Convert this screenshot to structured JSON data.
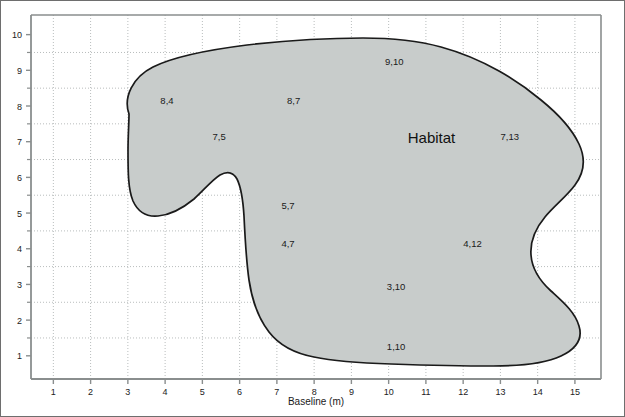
{
  "chart_data": {
    "type": "area",
    "title": "",
    "subtitle": "",
    "xlabel": "Baseline (m)",
    "ylabel": "",
    "xlim": [
      0.4,
      15.7
    ],
    "ylim": [
      0.35,
      10.55
    ],
    "xticks": [
      1,
      2,
      3,
      4,
      5,
      6,
      7,
      8,
      9,
      10,
      11,
      12,
      13,
      14,
      15
    ],
    "yticks": [
      1,
      2,
      3,
      4,
      5,
      6,
      7,
      8,
      9,
      10
    ],
    "xtick_labels": [
      "1",
      "2",
      "3",
      "4",
      "5",
      "6",
      "7",
      "8",
      "9",
      "10",
      "11",
      "12",
      "13",
      "14",
      "15"
    ],
    "ytick_labels": [
      "1",
      "2",
      "3",
      "4",
      "5",
      "6",
      "7",
      "8",
      "9",
      "10"
    ],
    "minor_yticks": [
      1.5,
      2.5,
      3.5,
      4.5,
      5.5,
      6.5,
      7.5,
      8.5,
      9.5
    ],
    "grid": true,
    "grid_style": "dotted",
    "legend": false,
    "legend_position": "none",
    "region_label": "Habitat",
    "fill_color": "#c8cccb",
    "outline_color": "#1a1a1a",
    "grid_color": "#b9bdbd",
    "axis_color": "#8a8e8e",
    "annotations": [
      {
        "text": "8,4",
        "x": 4.05,
        "y": 8.05
      },
      {
        "text": "8,7",
        "x": 7.45,
        "y": 8.05
      },
      {
        "text": "7,5",
        "x": 5.45,
        "y": 7.05
      },
      {
        "text": "9,10",
        "x": 10.15,
        "y": 9.15
      },
      {
        "text": "7,13",
        "x": 13.25,
        "y": 7.05
      },
      {
        "text": "5,7",
        "x": 7.3,
        "y": 5.1
      },
      {
        "text": "4,7",
        "x": 7.3,
        "y": 4.05
      },
      {
        "text": "4,12",
        "x": 12.25,
        "y": 4.05
      },
      {
        "text": "3,10",
        "x": 10.2,
        "y": 2.85
      },
      {
        "text": "1,10",
        "x": 10.2,
        "y": 1.15
      }
    ],
    "habitat_label_position": {
      "x": 11.15,
      "y": 6.95
    },
    "boundary_description": "Closed irregular habitat polygon spanning roughly x 1.2 to 15.2 and y 1.0 to 9.75, with a concave notch on the lower-left between x 3 and x 6.5 and an S-shaped indentation on the right edge near x 14.3."
  }
}
